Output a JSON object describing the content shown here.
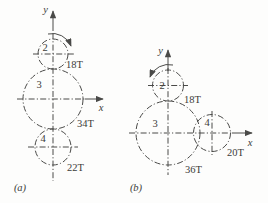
{
  "figure": {
    "colors": {
      "background": "#fdfdfc",
      "line": "#4a4a48",
      "text": "#3c3c3a"
    },
    "diagram_a": {
      "caption": "(a)",
      "y_axis_label": "y",
      "x_axis_label": "x",
      "rotation_icon": "clockwise-rotation-arrow-icon",
      "gears": [
        {
          "number": "2",
          "teeth": "18T"
        },
        {
          "number": "3",
          "teeth": "34T"
        },
        {
          "number": "4",
          "teeth": "22T"
        }
      ]
    },
    "diagram_b": {
      "caption": "(b)",
      "y_axis_label": "y",
      "x_axis_label": "x",
      "rotation_icon": "counterclockwise-rotation-arrow-icon",
      "gears": [
        {
          "number": "2",
          "teeth": "18T"
        },
        {
          "number": "3",
          "teeth": "36T"
        },
        {
          "number": "4",
          "teeth": "20T"
        }
      ]
    }
  }
}
